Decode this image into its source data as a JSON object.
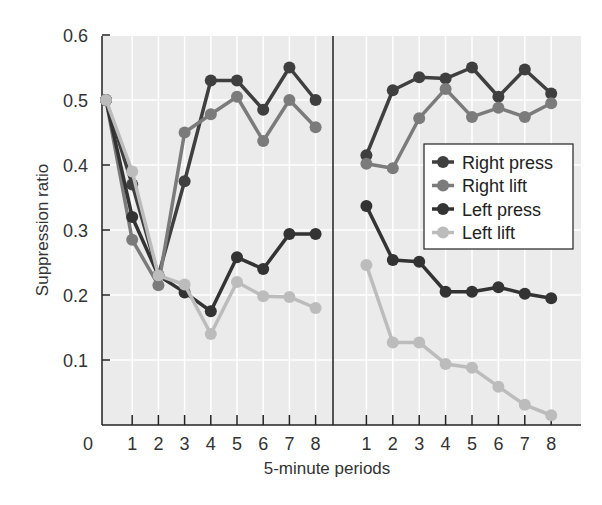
{
  "chart_data": {
    "type": "line",
    "title": "",
    "xlabel": "5-minute periods",
    "ylabel": "Suppression ratio",
    "ylim": [
      0,
      0.6
    ],
    "yticks": [
      "0.1",
      "0.2",
      "0.3",
      "0.4",
      "0.5",
      "0.6"
    ],
    "origin_label": "0",
    "grid": true,
    "legend_position": "right-center (inside right panel)",
    "panels": [
      {
        "name": "left",
        "x": [
          0,
          1,
          2,
          3,
          4,
          5,
          6,
          7,
          8
        ],
        "xtick_labels": [
          "1",
          "2",
          "3",
          "4",
          "5",
          "6",
          "7",
          "8"
        ]
      },
      {
        "name": "right",
        "x": [
          1,
          2,
          3,
          4,
          5,
          6,
          7,
          8
        ],
        "xtick_labels": [
          "1",
          "2",
          "3",
          "4",
          "5",
          "6",
          "7",
          "8"
        ]
      }
    ],
    "series": [
      {
        "name": "Right press",
        "color": "#3f3f3f",
        "left": [
          0.5,
          0.37,
          0.23,
          0.375,
          0.53,
          0.53,
          0.485,
          0.55,
          0.5
        ],
        "right": [
          0.415,
          0.515,
          0.535,
          0.533,
          0.55,
          0.505,
          0.547,
          0.51
        ]
      },
      {
        "name": "Right lift",
        "color": "#7b7b7b",
        "left": [
          0.5,
          0.285,
          0.215,
          0.45,
          0.478,
          0.505,
          0.437,
          0.5,
          0.458
        ],
        "right": [
          0.402,
          0.395,
          0.472,
          0.517,
          0.474,
          0.488,
          0.474,
          0.495
        ]
      },
      {
        "name": "Left press",
        "color": "#333333",
        "left": [
          0.5,
          0.32,
          0.23,
          0.204,
          0.175,
          0.258,
          0.24,
          0.294,
          0.294
        ],
        "right": [
          0.337,
          0.254,
          0.251,
          0.205,
          0.205,
          0.212,
          0.202,
          0.195
        ]
      },
      {
        "name": "Left lift",
        "color": "#bcbcbc",
        "left": [
          0.5,
          0.39,
          0.23,
          0.216,
          0.14,
          0.22,
          0.198,
          0.197,
          0.18
        ],
        "right": [
          0.246,
          0.127,
          0.127,
          0.094,
          0.088,
          0.059,
          0.031,
          0.015
        ]
      }
    ]
  },
  "colors": {
    "plot_background": "#ebebeb",
    "gridline": "#ffffff",
    "axis": "#222222"
  }
}
